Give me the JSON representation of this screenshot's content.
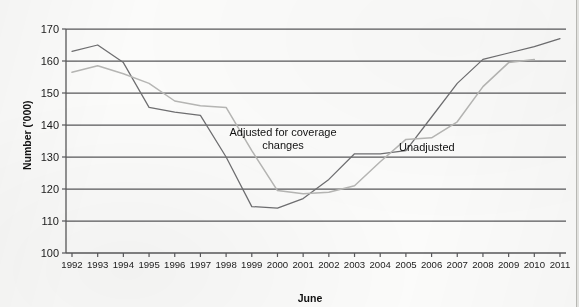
{
  "chart_data": {
    "type": "line",
    "title": "",
    "xlabel": "June",
    "ylabel": "Number ('000)",
    "ylim": [
      100,
      170
    ],
    "ystep": 10,
    "grid": true,
    "legend_position": "inline-annotations",
    "categories": [
      "1992",
      "1993",
      "1994",
      "1995",
      "1996",
      "1997",
      "1998",
      "1999",
      "2000",
      "2001",
      "2002",
      "2003",
      "2004",
      "2005",
      "2006",
      "2007",
      "2008",
      "2009",
      "2010",
      "2011"
    ],
    "ytick_labels": [
      "100",
      "110",
      "120",
      "130",
      "140",
      "150",
      "160",
      "170"
    ],
    "series": [
      {
        "name": "Unadjusted",
        "color": "#6e6e70",
        "values": [
          163.0,
          165.0,
          159.5,
          145.5,
          144.0,
          143.0,
          130.0,
          114.5,
          114.0,
          117.0,
          123.0,
          131.0,
          131.0,
          132.0,
          142.5,
          153.0,
          160.5,
          162.5,
          164.5,
          167.0
        ]
      },
      {
        "name": "Adjusted for coverage changes",
        "color": "#b6b6b4",
        "values": [
          156.5,
          158.5,
          156.0,
          153.0,
          147.5,
          146.0,
          145.5,
          132.0,
          119.5,
          118.5,
          119.0,
          121.0,
          128.5,
          135.5,
          136.0,
          141.0,
          152.0,
          159.5,
          160.5,
          null
        ]
      }
    ],
    "annotations": [
      {
        "text_line1": "Adjusted for coverage",
        "text_line2": "changes",
        "series": "Adjusted for coverage changes"
      },
      {
        "text_line1": "Unadjusted",
        "text_line2": "",
        "series": "Unadjusted"
      }
    ]
  }
}
